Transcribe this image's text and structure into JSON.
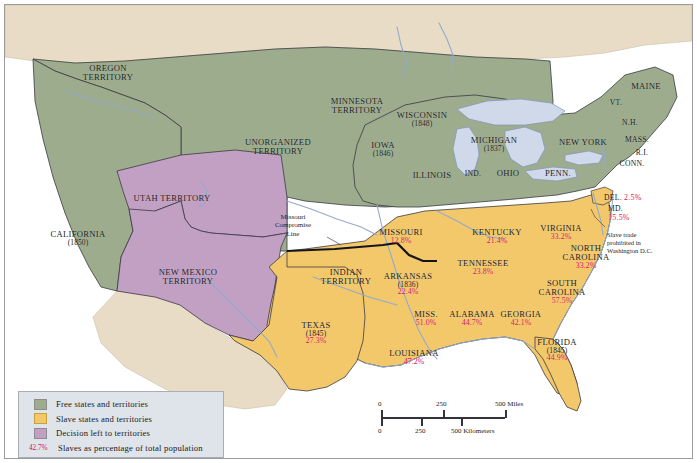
{
  "map": {
    "title": "Slavery and the Compromise of 1850",
    "colors": {
      "free": "#9cac8d",
      "slave": "#f3c86a",
      "territory_decision": "#c2a0c4",
      "foreign_land": "#e9dcc6",
      "water": "#ffffff",
      "lake": "#cfd9ea",
      "percent_text": "#d4145a",
      "label_text": "#1a1a22",
      "legend_bg": "#dfe3ea",
      "border": "#3a3a42"
    },
    "free_states": [
      {
        "name": "OREGON\nTERRITORY",
        "x": 103,
        "y": 68
      },
      {
        "name": "MINNESOTA\nTERRITORY",
        "x": 352,
        "y": 101
      },
      {
        "name": "UNORGANIZED\nTERRITORY",
        "x": 273,
        "y": 142
      },
      {
        "name": "WISCONSIN",
        "year": "(1848)",
        "x": 417,
        "y": 114
      },
      {
        "name": "MICHIGAN",
        "year": "(1837)",
        "x": 489,
        "y": 139
      },
      {
        "name": "IOWA",
        "year": "(1846)",
        "x": 378,
        "y": 144
      },
      {
        "name": "ILLINOIS",
        "x": 427,
        "y": 170
      },
      {
        "name": "IND.",
        "x": 468,
        "y": 169
      },
      {
        "name": "OHIO",
        "x": 503,
        "y": 168
      },
      {
        "name": "PENN.",
        "x": 553,
        "y": 168
      },
      {
        "name": "NEW YORK",
        "x": 578,
        "y": 137
      },
      {
        "name": "MAINE",
        "x": 641,
        "y": 81
      },
      {
        "name": "VT.",
        "x": 611,
        "y": 98
      },
      {
        "name": "N.H.",
        "x": 625,
        "y": 118
      },
      {
        "name": "MASS.",
        "x": 632,
        "y": 135
      },
      {
        "name": "R.I.",
        "x": 637,
        "y": 148
      },
      {
        "name": "CONN.",
        "x": 627,
        "y": 159
      },
      {
        "name": "CALIFORNIA",
        "year": "(1850)",
        "x": 73,
        "y": 233
      }
    ],
    "decision_territories": [
      {
        "name": "UTAH TERRITORY",
        "x": 167,
        "y": 193
      },
      {
        "name": "NEW MEXICO\nTERRITORY",
        "x": 183,
        "y": 272
      }
    ],
    "slave_states": [
      {
        "name": "MISSOURI",
        "pct": "12.8%",
        "x": 396,
        "y": 231
      },
      {
        "name": "KENTUCKY",
        "pct": "21.4%",
        "x": 492,
        "y": 231
      },
      {
        "name": "VIRGINIA",
        "pct": "33.2%",
        "x": 556,
        "y": 227
      },
      {
        "name": "NORTH\nCAROLINA",
        "pct": "33.2%",
        "x": 581,
        "y": 252
      },
      {
        "name": "SOUTH\nCAROLINA",
        "pct": "57.5%",
        "x": 557,
        "y": 287
      },
      {
        "name": "TENNESSEE",
        "pct": "23.8%",
        "x": 478,
        "y": 262
      },
      {
        "name": "ARKANSAS",
        "year": "(1836)",
        "pct": "22.4%",
        "x": 403,
        "y": 279
      },
      {
        "name": "INDIAN\nTERRITORY",
        "x": 341,
        "y": 272
      },
      {
        "name": "MISS.",
        "pct": "51.0%",
        "x": 421,
        "y": 313
      },
      {
        "name": "ALABAMA",
        "pct": "44.7%",
        "x": 467,
        "y": 313
      },
      {
        "name": "GEORGIA",
        "pct": "42.1%",
        "x": 516,
        "y": 313
      },
      {
        "name": "TEXAS",
        "year": "(1845)",
        "pct": "27.3%",
        "x": 311,
        "y": 328
      },
      {
        "name": "LOUISIANA",
        "pct": "47.2%",
        "x": 409,
        "y": 352
      },
      {
        "name": "FLORIDA",
        "year": "(1845)",
        "pct": "44.9%",
        "x": 552,
        "y": 345
      }
    ],
    "inline_states": [
      {
        "name": "DEL.",
        "pct": "2.5%",
        "x": 599,
        "y": 189
      },
      {
        "name": "MD.",
        "pct": "15.5%",
        "x": 603,
        "y": 200
      }
    ],
    "annotations": [
      {
        "id": "missouri-compromise",
        "text": "Missouri\nCompromise\nLine",
        "x": 284,
        "y": 215
      },
      {
        "id": "dc-note",
        "text": "Slave trade\nprohibited in\nWashington D.C.",
        "x": 602,
        "y": 225
      }
    ]
  },
  "legend": {
    "items": [
      {
        "swatch": "green",
        "label": "Free states and territories"
      },
      {
        "swatch": "orange",
        "label": "Slave states and territories"
      },
      {
        "swatch": "purple",
        "label": "Decision left to territories"
      }
    ],
    "percent_key": "42.7%",
    "percent_label": "Slaves as percentage of total population"
  },
  "scale": {
    "miles": {
      "ticks": [
        "0",
        "250",
        "500 Miles"
      ]
    },
    "kilometers": {
      "ticks": [
        "0",
        "250",
        "500 Kilometers"
      ]
    }
  }
}
